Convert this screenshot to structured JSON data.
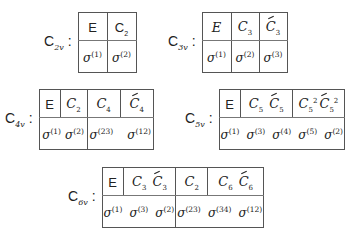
{
  "tables": [
    {
      "group": "C",
      "group_sub": "2v",
      "sep": ":",
      "header_cells": [
        {
          "ops": [
            {
              "sym": "E",
              "sub": "",
              "sup": "",
              "bar": false
            }
          ]
        },
        {
          "ops": [
            {
              "sym": "C",
              "sub": "2",
              "sup": "",
              "bar": false
            }
          ]
        }
      ],
      "sigma_cells": [
        {
          "sigmas": [
            {
              "sym": "σ",
              "sup": "(1)"
            }
          ]
        },
        {
          "sigmas": [
            {
              "sym": "σ",
              "sup": "(2)"
            }
          ]
        }
      ]
    },
    {
      "group": "C",
      "group_sub": "3v",
      "sep": ":",
      "header_cells": [
        {
          "ops": [
            {
              "sym": "E",
              "sub": "",
              "sup": "",
              "bar": false
            }
          ]
        },
        {
          "ops": [
            {
              "sym": "C",
              "sub": "3",
              "sup": "",
              "bar": false
            }
          ]
        },
        {
          "ops": [
            {
              "sym": "C",
              "sub": "3",
              "sup": "",
              "bar": true
            }
          ]
        }
      ],
      "sigma_cells": [
        {
          "sigmas": [
            {
              "sym": "σ",
              "sup": "(1)"
            }
          ]
        },
        {
          "sigmas": [
            {
              "sym": "σ",
              "sup": "(2)"
            }
          ]
        },
        {
          "sigmas": [
            {
              "sym": "σ",
              "sup": "(3)"
            }
          ]
        }
      ]
    },
    {
      "group": "C",
      "group_sub": "4v",
      "sep": ":",
      "header_cells": [
        {
          "ops": [
            {
              "sym": "E",
              "sub": "",
              "sup": "",
              "bar": false
            }
          ]
        },
        {
          "ops": [
            {
              "sym": "C",
              "sub": "2",
              "sup": "",
              "bar": false
            }
          ]
        },
        {
          "ops": [
            {
              "sym": "C",
              "sub": "4",
              "sup": "",
              "bar": false
            }
          ]
        },
        {
          "ops": [
            {
              "sym": "C",
              "sub": "4",
              "sup": "",
              "bar": true
            }
          ]
        }
      ],
      "sigma_cells": [
        {
          "sigmas": [
            {
              "sym": "σ",
              "sup": "(1)"
            },
            {
              "sym": "σ",
              "sup": "(2)"
            }
          ]
        },
        {
          "sigmas": [
            {
              "sym": "σ",
              "sup": "(23)"
            },
            {
              "sym": "σ",
              "sup": "(12)"
            }
          ]
        }
      ]
    },
    {
      "group": "C",
      "group_sub": "5v",
      "sep": ":",
      "header_cells": [
        {
          "ops": [
            {
              "sym": "E",
              "sub": "",
              "sup": "",
              "bar": false
            }
          ]
        },
        {
          "ops": [
            {
              "sym": "C",
              "sub": "5",
              "sup": "",
              "bar": false
            },
            {
              "sym": "C",
              "sub": "5",
              "sup": "",
              "bar": true
            }
          ]
        },
        {
          "ops": [
            {
              "sym": "C",
              "sub": "5",
              "sup": "2",
              "bar": false
            },
            {
              "sym": "C",
              "sub": "5",
              "sup": "2",
              "bar": true
            }
          ]
        }
      ],
      "sigma_cells": [
        {
          "sigmas": [
            {
              "sym": "σ",
              "sup": "(1)"
            },
            {
              "sym": "σ",
              "sup": "(3)"
            },
            {
              "sym": "σ",
              "sup": "(4)"
            },
            {
              "sym": "σ",
              "sup": "(5)"
            },
            {
              "sym": "σ",
              "sup": "(2)"
            }
          ]
        }
      ]
    },
    {
      "group": "C",
      "group_sub": "6v",
      "sep": ":",
      "header_cells": [
        {
          "ops": [
            {
              "sym": "E",
              "sub": "",
              "sup": "",
              "bar": false
            }
          ]
        },
        {
          "ops": [
            {
              "sym": "C",
              "sub": "3",
              "sup": "",
              "bar": false
            },
            {
              "sym": "C",
              "sub": "3",
              "sup": "",
              "bar": true
            }
          ]
        },
        {
          "ops": [
            {
              "sym": "C",
              "sub": "2",
              "sup": "",
              "bar": false
            }
          ]
        },
        {
          "ops": [
            {
              "sym": "C",
              "sub": "6",
              "sup": "",
              "bar": false
            },
            {
              "sym": "C",
              "sub": "6",
              "sup": "",
              "bar": true
            }
          ]
        }
      ],
      "sigma_cells": [
        {
          "sigmas": [
            {
              "sym": "σ",
              "sup": "(1)"
            },
            {
              "sym": "σ",
              "sup": "(3)"
            },
            {
              "sym": "σ",
              "sup": "(2)"
            }
          ]
        },
        {
          "sigmas": [
            {
              "sym": "σ",
              "sup": "(23)"
            },
            {
              "sym": "σ",
              "sup": "(34)"
            },
            {
              "sym": "σ",
              "sup": "(12)"
            }
          ]
        }
      ]
    }
  ]
}
